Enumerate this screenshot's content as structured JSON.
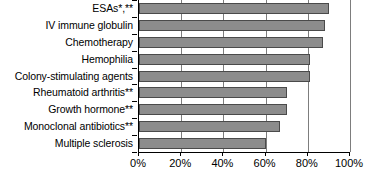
{
  "chart_data": {
    "type": "bar",
    "orientation": "horizontal",
    "title": "",
    "xlabel": "",
    "ylabel": "",
    "xlim": [
      0,
      100
    ],
    "xticks": [
      0,
      20,
      40,
      60,
      80,
      100
    ],
    "xticklabels": [
      "0%",
      "20%",
      "40%",
      "60%",
      "80%",
      "100%"
    ],
    "grid": true,
    "grid_axis": "x",
    "legend": false,
    "categories": [
      "ESAs*,**",
      "IV immune globulin",
      "Chemotherapy",
      "Hemophilia",
      "Colony-stimulating agents",
      "Rheumatoid arthritis**",
      "Growth hormone**",
      "Monoclonal antibiotics**",
      "Multiple sclerosis"
    ],
    "values": [
      90,
      88,
      87,
      81,
      81,
      70,
      70,
      67,
      60
    ],
    "value_unit": "%",
    "bar_color": "#8c8c8c",
    "bar_edge_color": "#4a4a4a",
    "axis_color": "#000000",
    "gridline_color": "#7d7d7d"
  }
}
